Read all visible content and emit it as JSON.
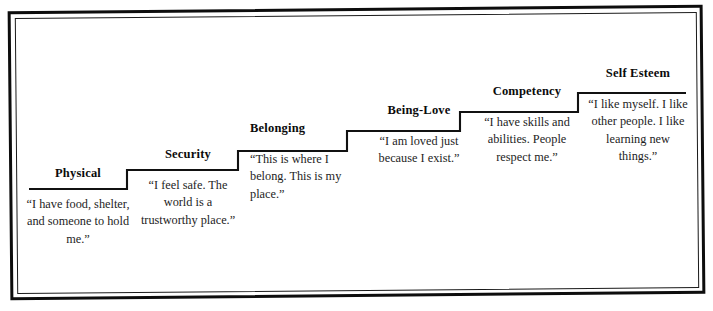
{
  "figure": {
    "type": "staircase-diagram",
    "title": "",
    "frame_color": "#0d0d0d",
    "background_color": "#ffffff",
    "text_color": "#1d1d1d"
  },
  "steps": [
    {
      "label": "Physical",
      "quote": "“I have food, shelter, and someone to hold me.”",
      "align": "center",
      "order": 1
    },
    {
      "label": "Security",
      "quote": "“I feel safe. The world is a trustworthy place.”",
      "align": "center",
      "order": 2
    },
    {
      "label": "Belonging",
      "quote": "“This is where I belong. This is my place.”",
      "align": "left",
      "order": 3
    },
    {
      "label": "Being-Love",
      "quote": "“I am loved just because I exist.”",
      "align": "center",
      "order": 4
    },
    {
      "label": "Competency",
      "quote": "“I have skills and abilities. People respect me.”",
      "align": "center",
      "order": 5
    },
    {
      "label": "Self Esteem",
      "quote": "“I like myself. I like other people. I like learning new things.”",
      "align": "center",
      "order": 6
    }
  ]
}
